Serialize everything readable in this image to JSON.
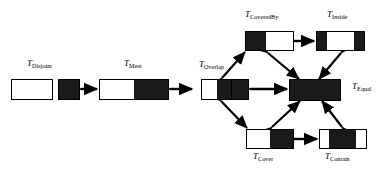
{
  "figure": {
    "background_color": "#ffffff",
    "fill_color": "#1a1a1a",
    "outline_color": "#000000"
  },
  "nodes": [
    {
      "id": "disjoint",
      "label_symbol": "T",
      "label_subscript": "Disjoint",
      "label_full": "T_Disjoint",
      "description": "two separate rectangles: one white, one black, not touching"
    },
    {
      "id": "meet",
      "label_symbol": "T",
      "label_subscript": "Meet",
      "label_full": "T_Meet",
      "description": "single rectangle split into white left half and black right half"
    },
    {
      "id": "overlap",
      "label_symbol": "T",
      "label_subscript": "Overlap",
      "label_full": "T_Overlap",
      "description": "rectangle with white left third and black right two thirds divided by a line"
    },
    {
      "id": "coveredby",
      "label_symbol": "T",
      "label_subscript": "CoveredBy",
      "label_full": "T_CoveredBy",
      "description": "rectangle with black left portion and white right portion"
    },
    {
      "id": "inside",
      "label_symbol": "T",
      "label_subscript": "Inside",
      "label_full": "T_Inside",
      "description": "rectangle with black ends and white middle"
    },
    {
      "id": "equal",
      "label_symbol": "T",
      "label_subscript": "Equal",
      "label_full": "T_Equal",
      "description": "fully solid black rectangle"
    },
    {
      "id": "cover",
      "label_symbol": "T",
      "label_subscript": "Cover",
      "label_full": "T_Cover",
      "description": "rectangle with white left portion and black right portion"
    },
    {
      "id": "contain",
      "label_symbol": "T",
      "label_subscript": "Contain",
      "label_full": "T_Contain",
      "description": "rectangle with white ends and black middle"
    }
  ],
  "edges": [
    {
      "from": "disjoint",
      "to": "meet",
      "style": "double-arrow"
    },
    {
      "from": "meet",
      "to": "overlap",
      "style": "double-arrow"
    },
    {
      "from": "overlap",
      "to": "equal",
      "style": "double-arrow"
    },
    {
      "from": "overlap",
      "to": "coveredby",
      "style": "double-arrow"
    },
    {
      "from": "overlap",
      "to": "cover",
      "style": "double-arrow"
    },
    {
      "from": "coveredby",
      "to": "equal",
      "style": "double-arrow"
    },
    {
      "from": "inside",
      "to": "equal",
      "style": "double-arrow"
    },
    {
      "from": "coveredby",
      "to": "inside",
      "style": "double-arrow"
    },
    {
      "from": "cover",
      "to": "equal",
      "style": "double-arrow"
    },
    {
      "from": "contain",
      "to": "equal",
      "style": "double-arrow"
    },
    {
      "from": "cover",
      "to": "contain",
      "style": "double-arrow"
    }
  ]
}
